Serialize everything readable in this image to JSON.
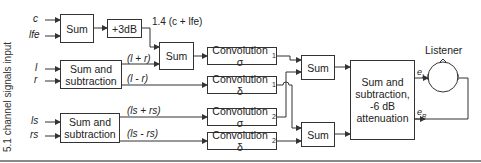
{
  "diagram": {
    "side_label": "5.1 channel signals input",
    "inputs": [
      "c",
      "lfe",
      "l",
      "r",
      "ls",
      "rs"
    ],
    "blocks": {
      "sum_c_lfe": "Sum",
      "gain_3db": "+3dB",
      "sum_front": "Sum",
      "sumsub_front": "Sum and subtraction",
      "sumsub_rear": "Sum and subtraction",
      "conv_sigma1": "Convolution σ",
      "conv_sigma1_sub": "1",
      "conv_delta1": "Convolution δ",
      "conv_delta1_sub": "1",
      "conv_sigma2": "Convolution σ",
      "conv_sigma2_sub": "2",
      "conv_delta2": "Convolution δ",
      "conv_delta2_sub": "2",
      "sum_left": "Sum",
      "sum_right": "Sum",
      "final": "Sum and subtraction, -6 dB attenuation"
    },
    "signal_labels": {
      "center_lfe": "1.4 (c + lfe)",
      "l_plus_r": "(l + r)",
      "l_minus_r": "(l - r)",
      "ls_plus_rs": "(ls + rs)",
      "ls_minus_rs": "(ls - rs)",
      "eL": "e",
      "eL_sub": "L",
      "eR": "e",
      "eR_sub": "R"
    },
    "listener_label": "Listener",
    "colors": {
      "stroke": "#333333",
      "background": "#ffffff",
      "text": "#222222"
    }
  }
}
